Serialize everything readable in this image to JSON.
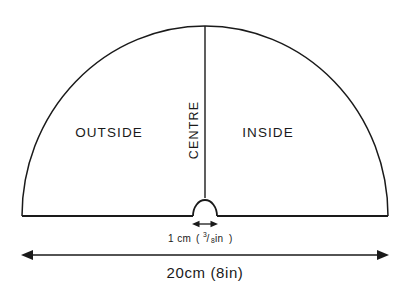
{
  "diagram": {
    "background_color": "#ffffff",
    "line_color": "#1a1a1a",
    "regions": {
      "left_label": "OUTSIDE",
      "right_label": "INSIDE",
      "centre_label": "CENTRE"
    },
    "dimensions": {
      "neck": {
        "text_metric": "1 cm",
        "text_open_paren": "(",
        "frac_numerator": "3",
        "frac_slash": "/",
        "frac_denominator": "8",
        "text_imperial_unit": " in",
        "text_close_paren": ")",
        "full_text": "1 cm (3/8 in)"
      },
      "overall": {
        "full_text": "20cm (8in)",
        "metric_value": "20cm",
        "imperial_value": "(8in)"
      }
    },
    "geometry": {
      "centre_x": 205,
      "baseline_y": 216,
      "radius": 183,
      "apex_y": 26,
      "neck_radius": 12,
      "left_edge_x": 22,
      "right_edge_x": 388,
      "centre_line_top_y": 26,
      "centre_line_bottom_y": 198,
      "main_arrow_y": 255,
      "neck_arrow_y": 224,
      "neck_arrow_left_x": 193,
      "neck_arrow_right_x": 217
    }
  }
}
